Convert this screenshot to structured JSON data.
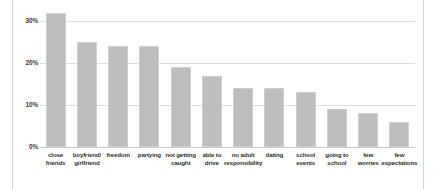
{
  "chart_data": {
    "type": "bar",
    "title": "",
    "subtitle": "",
    "xlabel": "",
    "ylabel": "",
    "ylim": [
      0,
      33
    ],
    "grid": true,
    "legend": "none",
    "orientation": "vertical",
    "value_suffix": "%",
    "categories": [
      "close friends",
      "boyfriend/ girlfriend",
      "freedom",
      "partying",
      "not getting caught",
      "able to drive",
      "no adult responsibility",
      "dating",
      "school events",
      "going to school",
      "few worries",
      "few expectations"
    ],
    "category_lines": [
      [
        "close",
        "friends"
      ],
      [
        "boyfriend/",
        "girlfriend"
      ],
      [
        "freedom",
        ""
      ],
      [
        "partying",
        ""
      ],
      [
        "not getting",
        "caught"
      ],
      [
        "able to",
        "drive"
      ],
      [
        "no adult",
        "responsibility"
      ],
      [
        "dating",
        ""
      ],
      [
        "school",
        "events"
      ],
      [
        "going to",
        "school"
      ],
      [
        "few",
        "worries"
      ],
      [
        "few",
        "expectations"
      ]
    ],
    "values": [
      32,
      25,
      24,
      24,
      19,
      17,
      14,
      14,
      13,
      9,
      8,
      6
    ],
    "yticks": [
      0,
      10,
      20,
      30
    ],
    "ytick_labels": [
      "0%",
      "10%",
      "20%",
      "30%"
    ],
    "colors": {
      "bar_fill": "#bdbdbd",
      "bar_border": "#cfcfcf",
      "gridline": "#dcdcdc",
      "axis": "#c9c9c9",
      "text": "#2f2f2f",
      "background": "#ffffff",
      "frame": "#d6d6d6"
    }
  }
}
